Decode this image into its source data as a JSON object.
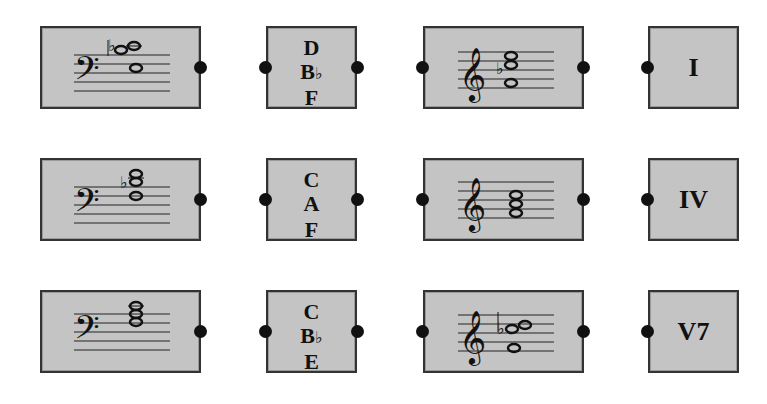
{
  "colors": {
    "box_fill": "#c4c4c4",
    "border": "#333333",
    "dot": "#111111"
  },
  "rows": [
    {
      "bass": {
        "clef": "bass",
        "notes": [
          "F",
          "Bb",
          "D"
        ],
        "accidental": "flat"
      },
      "names": {
        "top": "D",
        "middle": "B",
        "middle_accidental": "♭",
        "bottom": "F"
      },
      "treble": {
        "clef": "treble",
        "notes": [
          "F",
          "Bb",
          "D"
        ],
        "accidental": "flat"
      },
      "roman": "I"
    },
    {
      "bass": {
        "clef": "bass",
        "notes": [
          "F",
          "A",
          "C"
        ],
        "accidental": "flat"
      },
      "names": {
        "top": "C",
        "middle": "A",
        "middle_accidental": "",
        "bottom": "F"
      },
      "treble": {
        "clef": "treble",
        "notes": [
          "F",
          "A",
          "C"
        ],
        "accidental": ""
      },
      "roman": "IV"
    },
    {
      "bass": {
        "clef": "bass",
        "notes": [
          "E",
          "G",
          "Bb",
          "C"
        ],
        "accidental": ""
      },
      "names": {
        "top": "C",
        "middle": "B",
        "middle_accidental": "♭",
        "bottom": "E"
      },
      "treble": {
        "clef": "treble",
        "notes": [
          "E",
          "Bb",
          "C"
        ],
        "accidental": "flat"
      },
      "roman": "V7"
    }
  ]
}
